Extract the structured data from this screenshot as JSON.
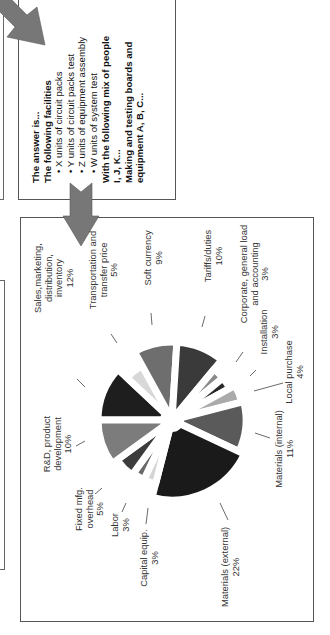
{
  "answer_box": {
    "lines": [
      {
        "text": "The answer is...",
        "bold": true,
        "bullet": false
      },
      {
        "text": "The following facilities",
        "bold": true,
        "bullet": false
      },
      {
        "text": "• X units of circuit packs",
        "bold": false,
        "bullet": true
      },
      {
        "text": "• Y units of circuit packs test",
        "bold": false,
        "bullet": true
      },
      {
        "text": "• Z units of equipment assembly",
        "bold": false,
        "bullet": true
      },
      {
        "text": "• W units of system test",
        "bold": false,
        "bullet": true
      },
      {
        "text": "With the following mix of people",
        "bold": true,
        "bullet": false
      },
      {
        "text": "I, J, K...",
        "bold": true,
        "bullet": false
      },
      {
        "text": "Making and testing boards and",
        "bold": true,
        "bullet": false
      },
      {
        "text": "equipment A, B, C...",
        "bold": true,
        "bullet": false
      }
    ]
  },
  "arrows": {
    "color": "#777777",
    "diagonal_arrow": "arrow-down-right-icon",
    "down_arrow": "arrow-down-icon"
  },
  "chart_data": {
    "type": "pie",
    "title": "",
    "orientation": "rotated 90° counter-clockwise",
    "exploded": true,
    "slices": [
      {
        "label": "Sales,marketing, distribution, inventory",
        "value": 12,
        "color": "#1e1e1e",
        "r": 74
      },
      {
        "label": "Transportation and transfer price",
        "value": 5,
        "color": "#d8d8d8",
        "r": 62
      },
      {
        "label": "Soft currency",
        "value": 9,
        "color": "#6e6e6e",
        "r": 78
      },
      {
        "label": "Tariffs/duties",
        "value": 10,
        "color": "#3a3a3a",
        "r": 78
      },
      {
        "label": "Corporate, general load and accounting",
        "value": 3,
        "color": "#8a8a8a",
        "r": 66
      },
      {
        "label": "Installation",
        "value": 3,
        "color": "#2a2a2a",
        "r": 66
      },
      {
        "label": "Local purchase",
        "value": 4,
        "color": "#aaaaaa",
        "r": 72
      },
      {
        "label": "Materials (internal)",
        "value": 11,
        "color": "#5a5a5a",
        "r": 74
      },
      {
        "label": "Materials (external)",
        "value": 22,
        "color": "#1a1a1a",
        "r": 80
      },
      {
        "label": "Capital equip.",
        "value": 3,
        "color": "#d4d4d4",
        "r": 66
      },
      {
        "label": "Labor",
        "value": 3,
        "color": "#6a6a6a",
        "r": 66
      },
      {
        "label": "Fixed mfg. overhead",
        "value": 5,
        "color": "#3c3c3c",
        "r": 68
      },
      {
        "label": "R&D, product development",
        "value": 10,
        "color": "#7c7c7c",
        "r": 74
      }
    ],
    "start_angle_deg": 180,
    "legend": "none (callout labels with leader lines)"
  },
  "pie_labels": [
    {
      "lines": [
        "Sales,marketing,",
        "distribution,",
        "inventory",
        "12%"
      ],
      "x": 54,
      "y": 278,
      "lx1": 85,
      "ly1": 387,
      "lx2": 77,
      "ly2": 379
    },
    {
      "lines": [
        "Transportation and",
        "transfer price",
        "5%"
      ],
      "x": 104,
      "y": 270,
      "lx1": 117,
      "ly1": 343,
      "lx2": 111,
      "ly2": 334
    },
    {
      "lines": [
        "Soft currency",
        "9%"
      ],
      "x": 154,
      "y": 258,
      "lx1": 152,
      "ly1": 325,
      "lx2": 151,
      "ly2": 313
    },
    {
      "lines": [
        "Tariffs/duties",
        "10%"
      ],
      "x": 214,
      "y": 256,
      "lx1": 202,
      "ly1": 327,
      "lx2": 205,
      "ly2": 316
    },
    {
      "lines": [
        "Corporate, general load",
        "and accounting",
        "3%"
      ],
      "x": 255,
      "y": 274,
      "lx1": 236,
      "ly1": 362,
      "lx2": 243,
      "ly2": 352
    },
    {
      "lines": [
        "Installation",
        "3%"
      ],
      "x": 270,
      "y": 332,
      "lx1": 250,
      "ly1": 376,
      "lx2": 256,
      "ly2": 370
    },
    {
      "lines": [
        "Local purchase",
        "4%"
      ],
      "x": 295,
      "y": 372,
      "lx1": 254,
      "ly1": 391,
      "lx2": 283,
      "ly2": 383
    },
    {
      "lines": [
        "Materials (internal)",
        "11%"
      ],
      "x": 285,
      "y": 449,
      "lx1": 255,
      "ly1": 433,
      "lx2": 270,
      "ly2": 438
    },
    {
      "lines": [
        "Materials (external)",
        "22%"
      ],
      "x": 231,
      "y": 567,
      "lx1": 220,
      "ly1": 503,
      "lx2": 228,
      "ly2": 520
    },
    {
      "lines": [
        "Capital equip.",
        "3%"
      ],
      "x": 150,
      "y": 558,
      "lx1": 148,
      "ly1": 508,
      "lx2": 146,
      "ly2": 524
    },
    {
      "lines": [
        "Labor",
        "3%"
      ],
      "x": 121,
      "y": 525,
      "lx1": 126,
      "ly1": 503,
      "lx2": 122,
      "ly2": 512
    },
    {
      "lines": [
        "Fixed mfg.",
        "overhead",
        "5%"
      ],
      "x": 90,
      "y": 509,
      "lx1": 102,
      "ly1": 488,
      "lx2": 95,
      "ly2": 494
    },
    {
      "lines": [
        "R&D, product",
        "development",
        "10%"
      ],
      "x": 58,
      "y": 444,
      "lx1": 85,
      "ly1": 441,
      "lx2": 76,
      "ly2": 446
    }
  ],
  "pie_center": {
    "x": 172,
    "y": 420
  }
}
